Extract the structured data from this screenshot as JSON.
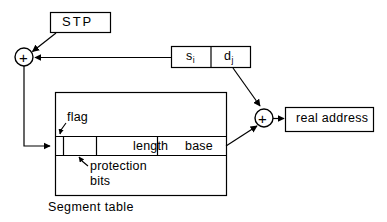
{
  "diagram": {
    "caption": "Segment table",
    "stroke_color": "#000000",
    "background_color": "#ffffff",
    "nodes": {
      "stp_box": {
        "label": "STP"
      },
      "adder_left": {
        "label": "+"
      },
      "adder_right": {
        "label": "+"
      },
      "virtual_address": {
        "segment_field": {
          "base": "s",
          "subscript": "i"
        },
        "displacement_field": {
          "base": "d",
          "subscript": "j"
        }
      },
      "real_address_box": {
        "label": "real address"
      },
      "segment_table": {
        "caption": "Segment table",
        "entry_fields": [
          {
            "name": "flag",
            "label": ""
          },
          {
            "name": "protection-bits",
            "label": ""
          },
          {
            "name": "length",
            "label": "length"
          },
          {
            "name": "base",
            "label": "base"
          }
        ]
      }
    },
    "annotations": {
      "flag": "flag",
      "protection_line1": "protection",
      "protection_line2": "bits"
    }
  }
}
